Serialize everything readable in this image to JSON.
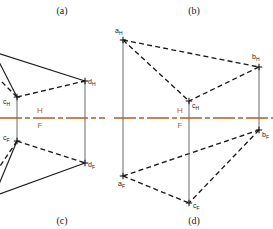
{
  "page": {
    "background": "#ffffff",
    "width": 273,
    "height": 229
  },
  "colors": {
    "line": "#1a1a1a",
    "reference_line": "#b45f1a",
    "plane_label": "#c1600f",
    "projector": "#6b6b6b",
    "accent_green": "#3a9a55",
    "accent_blue": "#3b4fa0"
  },
  "captions": [
    {
      "id": "caption-a",
      "text": "(a)",
      "x": 62,
      "y": 14
    },
    {
      "id": "caption-b",
      "text": "(b)",
      "x": 194,
      "y": 14
    },
    {
      "id": "caption-c",
      "text": "(c)",
      "x": 62,
      "y": 224
    },
    {
      "id": "caption-d",
      "text": "(d)",
      "x": 194,
      "y": 224
    }
  ],
  "reference_line": {
    "name": "h-f-reference-line",
    "label_above": "H",
    "label_below": "F",
    "left": {
      "x1": 0,
      "x2": 105,
      "y": 118,
      "label_x": 40,
      "label_above_y": 113,
      "label_below_y": 128
    },
    "right": {
      "x1": 114,
      "x2": 273,
      "y": 118,
      "label_x": 180,
      "label_above_y": 113,
      "label_below_y": 128
    }
  },
  "figure_left": {
    "name": "figure-ac-quadrilateral",
    "points": [
      {
        "id": "c_H",
        "letter": "c",
        "sub": "H",
        "x": 17,
        "y": 97,
        "label_x": 3,
        "label_y": 104
      },
      {
        "id": "d_H",
        "letter": "d",
        "sub": "H",
        "x": 85,
        "y": 81,
        "label_x": 88,
        "label_y": 84
      },
      {
        "id": "c_F",
        "letter": "c",
        "sub": "F",
        "x": 17,
        "y": 141,
        "label_x": 3,
        "label_y": 140
      },
      {
        "id": "d_F",
        "letter": "d",
        "sub": "F",
        "x": 85,
        "y": 163,
        "label_x": 88,
        "label_y": 167
      }
    ],
    "projectors": [
      {
        "name": "projector-c",
        "x": 17,
        "y1": 97,
        "y2": 141
      },
      {
        "name": "projector-d",
        "x": 85,
        "y1": 81,
        "y2": 163
      }
    ],
    "solid_edges": [
      {
        "name": "edge-top-left-solid",
        "x1": -6,
        "y1": 52,
        "x2": 85,
        "y2": 81
      },
      {
        "name": "edge-top-to-c-solid",
        "x1": -6,
        "y1": 52,
        "x2": 17,
        "y2": 97
      },
      {
        "name": "edge-bottom-left-solid",
        "x1": -6,
        "y1": 196,
        "x2": 85,
        "y2": 163
      },
      {
        "name": "edge-bottom-to-cf-solid",
        "x1": -6,
        "y1": 196,
        "x2": 17,
        "y2": 141
      }
    ],
    "dashed_edges": [
      {
        "name": "edge-ch-dh-dashed",
        "x1": 17,
        "y1": 97,
        "x2": 85,
        "y2": 81
      },
      {
        "name": "edge-ch-left-dashed",
        "x1": 17,
        "y1": 97,
        "x2": -8,
        "y2": 72
      },
      {
        "name": "edge-cf-df-dashed",
        "x1": 17,
        "y1": 141,
        "x2": 85,
        "y2": 163
      },
      {
        "name": "edge-cf-left-dashed",
        "x1": 17,
        "y1": 141,
        "x2": -8,
        "y2": 178
      }
    ]
  },
  "figure_right": {
    "name": "figure-bd-triangle",
    "points": [
      {
        "id": "a_H",
        "letter": "a",
        "sub": "H",
        "x": 123,
        "y": 40,
        "label_x": 115,
        "label_y": 33
      },
      {
        "id": "b_H",
        "letter": "b",
        "sub": "H",
        "x": 259,
        "y": 67,
        "label_x": 252,
        "label_y": 59
      },
      {
        "id": "c_H",
        "letter": "c",
        "sub": "H",
        "x": 189,
        "y": 101,
        "label_x": 192,
        "label_y": 108
      },
      {
        "id": "a_F",
        "letter": "a",
        "sub": "F",
        "x": 123,
        "y": 176,
        "label_x": 118,
        "label_y": 186
      },
      {
        "id": "b_F",
        "letter": "b",
        "sub": "F",
        "x": 259,
        "y": 130,
        "label_x": 262,
        "label_y": 137
      },
      {
        "id": "c_F",
        "letter": "c",
        "sub": "F",
        "x": 189,
        "y": 203,
        "label_x": 193,
        "label_y": 208
      }
    ],
    "projectors": [
      {
        "name": "projector-a",
        "x": 123,
        "y1": 40,
        "y2": 176
      },
      {
        "name": "projector-b",
        "x": 259,
        "y1": 67,
        "y2": 130
      },
      {
        "name": "projector-c",
        "x": 189,
        "y1": 101,
        "y2": 203
      }
    ],
    "top_triangle_edges": [
      {
        "name": "edge-ah-bh-dashed",
        "x1": 123,
        "y1": 40,
        "x2": 259,
        "y2": 67
      },
      {
        "name": "edge-ah-ch-dashed",
        "x1": 123,
        "y1": 40,
        "x2": 189,
        "y2": 101
      },
      {
        "name": "edge-bh-ch-dashed",
        "x1": 259,
        "y1": 67,
        "x2": 189,
        "y2": 101
      }
    ],
    "bottom_triangle_edges": [
      {
        "name": "edge-af-bf-dashed",
        "x1": 123,
        "y1": 176,
        "x2": 259,
        "y2": 130
      },
      {
        "name": "edge-af-cf-dashed",
        "x1": 123,
        "y1": 176,
        "x2": 189,
        "y2": 203
      },
      {
        "name": "edge-bf-cf-dashed",
        "x1": 259,
        "y1": 130,
        "x2": 189,
        "y2": 203
      }
    ]
  }
}
